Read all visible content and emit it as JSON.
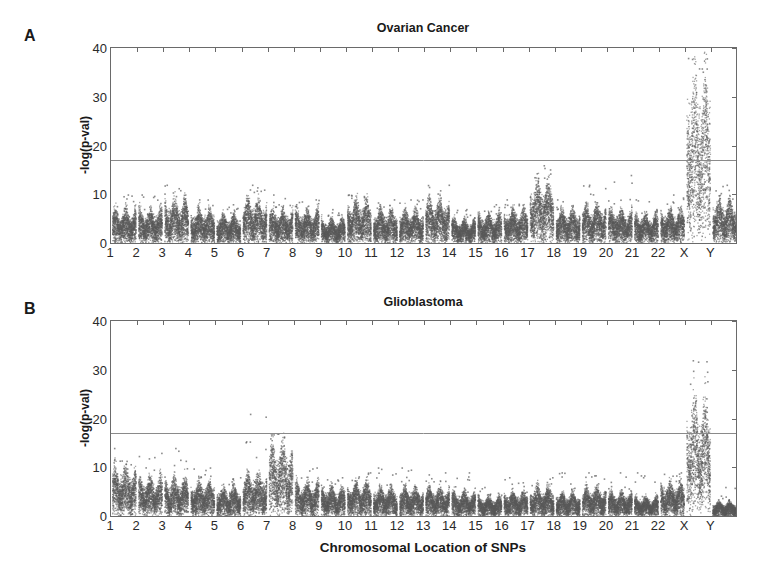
{
  "figure": {
    "x_axis_label": "Chromosomal Location of SNPs",
    "y_axis_label": "-log(p-val)",
    "y_ticks": [
      "0",
      "10",
      "20",
      "30",
      "40"
    ],
    "x_ticks": [
      "1",
      "2",
      "3",
      "4",
      "5",
      "6",
      "7",
      "8",
      "9",
      "10",
      "11",
      "12",
      "13",
      "14",
      "15",
      "16",
      "17",
      "18",
      "19",
      "20",
      "21",
      "22",
      "X",
      "Y"
    ],
    "point_color": "#5a5a5a",
    "threshold_color": "#8a8a8a"
  },
  "chart_data": [
    {
      "panel": "A",
      "type": "scatter",
      "title": "Ovarian Cancer",
      "xlabel": "",
      "ylabel": "-log(p-val)",
      "ylim": [
        0,
        40
      ],
      "yticks": [
        0,
        10,
        20,
        30,
        40
      ],
      "categories": [
        "1",
        "2",
        "3",
        "4",
        "5",
        "6",
        "7",
        "8",
        "9",
        "10",
        "11",
        "12",
        "13",
        "14",
        "15",
        "16",
        "17",
        "18",
        "19",
        "20",
        "21",
        "22",
        "X",
        "Y"
      ],
      "significance_threshold": 17,
      "grid": false,
      "series": [
        {
          "name": "typical max -log(p) per chromosome",
          "values": [
            7,
            7,
            9,
            7,
            6,
            9,
            7,
            7,
            5,
            9,
            7,
            7,
            9,
            5,
            6,
            7,
            13,
            7,
            8,
            7,
            6,
            7,
            35,
            9
          ]
        },
        {
          "name": "max outlier -log(p) per chromosome",
          "values": [
            10,
            10,
            12,
            9,
            8,
            12,
            10,
            9,
            7,
            10,
            9,
            9,
            12,
            7,
            8,
            9,
            16,
            9,
            12,
            14,
            9,
            10,
            38,
            12
          ]
        }
      ]
    },
    {
      "panel": "B",
      "type": "scatter",
      "title": "Glioblastoma",
      "xlabel": "Chromosomal Location of SNPs",
      "ylabel": "-log(p-val)",
      "ylim": [
        0,
        40
      ],
      "yticks": [
        0,
        10,
        20,
        30,
        40
      ],
      "categories": [
        "1",
        "2",
        "3",
        "4",
        "5",
        "6",
        "7",
        "8",
        "9",
        "10",
        "11",
        "12",
        "13",
        "14",
        "15",
        "16",
        "17",
        "18",
        "19",
        "20",
        "21",
        "22",
        "X",
        "Y"
      ],
      "significance_threshold": 17,
      "grid": false,
      "series": [
        {
          "name": "typical max -log(p) per chromosome",
          "values": [
            10,
            8,
            8,
            7,
            6,
            9,
            15,
            7,
            6,
            7,
            6,
            6,
            6,
            5,
            4,
            5,
            6,
            5,
            6,
            5,
            4,
            7,
            25,
            3
          ]
        },
        {
          "name": "max outlier -log(p) per chromosome",
          "values": [
            14,
            13,
            14,
            10,
            8,
            21,
            17,
            10,
            8,
            9,
            10,
            10,
            9,
            9,
            6,
            8,
            8,
            9,
            9,
            9,
            9,
            9,
            32,
            6
          ]
        }
      ]
    }
  ]
}
